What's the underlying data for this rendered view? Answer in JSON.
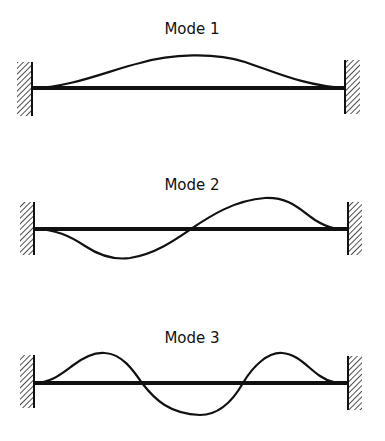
{
  "figure": {
    "colors": {
      "background": "#ffffff",
      "ink": "#111111"
    },
    "modes": [
      {
        "label": "Mode 1",
        "title_center_x": 192,
        "title_baseline_y": 34,
        "beam_y": 88,
        "beam_x_start": 32,
        "beam_x_end": 345,
        "left_wall": {
          "x": 17,
          "y": 62,
          "width": 15,
          "height": 54
        },
        "right_wall": {
          "x": 345,
          "y": 60,
          "width": 15,
          "height": 54
        },
        "curve_path": "M 32 88 C 70 88, 110 70, 140 63 C 170 54, 215 52, 245 62 C 275 72, 305 86, 345 88"
      },
      {
        "label": "Mode 2",
        "title_center_x": 192,
        "title_baseline_y": 190,
        "beam_y": 229,
        "beam_x_start": 34,
        "beam_x_end": 348,
        "left_wall": {
          "x": 20,
          "y": 202,
          "width": 14,
          "height": 53
        },
        "right_wall": {
          "x": 348,
          "y": 202,
          "width": 14,
          "height": 53
        },
        "curve_path": "M 34 229 C 55 229, 70 236, 85 246 C 100 256, 115 260, 130 258 C 155 254, 175 240, 191 229 C 210 216, 235 200, 265 198 C 290 197, 300 210, 315 220 C 328 228, 335 229, 348 229"
      },
      {
        "label": "Mode 3",
        "title_center_x": 192,
        "title_baseline_y": 343,
        "beam_y": 383,
        "beam_x_start": 34,
        "beam_x_end": 348,
        "left_wall": {
          "x": 20,
          "y": 355,
          "width": 14,
          "height": 53
        },
        "right_wall": {
          "x": 348,
          "y": 356,
          "width": 14,
          "height": 54
        },
        "curve_path": "M 34 383 C 50 383, 60 375, 72 366 C 85 356, 95 352, 105 353 C 122 354, 133 370, 142 383 C 155 400, 170 414, 200 415 C 222 415, 235 397, 243 383 C 253 366, 268 352, 282 353 C 298 354, 308 368, 320 376 C 330 383, 338 383, 348 383"
      }
    ]
  }
}
